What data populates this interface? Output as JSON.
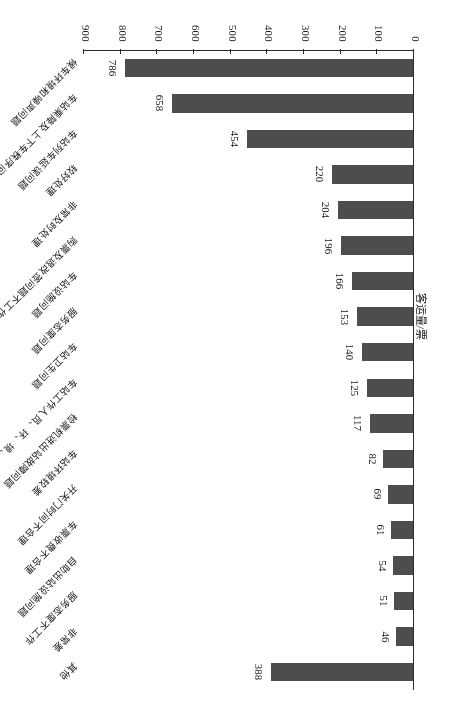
{
  "chart_data": {
    "type": "bar",
    "orientation": "horizontal",
    "title": "",
    "xlabel": "",
    "ylabel": "客运量/票",
    "ylim": [
      0,
      900
    ],
    "tick_step": 100,
    "grid": false,
    "legend": null,
    "axis_ticks": [
      "0",
      "100",
      "200",
      "300",
      "400",
      "500",
      "600",
      "700",
      "800",
      "900"
    ],
    "categories": [
      "其他",
      "非常差",
      "服务态度不工作",
      "自助出站设施问题",
      "车票收费不合理",
      "开关门时间不合理",
      "车站环境较差",
      "检票机进出站故障问题",
      "车站工作人员、环、境、秩序问题",
      "车站卫生问题",
      "服务态度问题",
      "车站设施问题",
      "购票及退改签问题不工作",
      "非常及时处理",
      "较好处理",
      "车站列车延误问题",
      "车站乘降及上下车秩序问题、其他",
      "候车环境和噪声问题"
    ],
    "values": [
      388,
      46,
      51,
      54,
      61,
      69,
      82,
      117,
      125,
      140,
      153,
      166,
      196,
      204,
      220,
      454,
      658,
      786
    ],
    "bar_color": "#4d4d4d",
    "axis_color": "#2b2b2b"
  }
}
